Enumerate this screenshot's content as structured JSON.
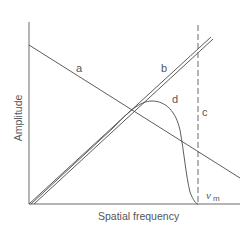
{
  "diagram": {
    "axes": {
      "ylabel": "Amplitude",
      "xlabel": "Spatial frequency"
    },
    "curves": [
      {
        "id": "a",
        "label": "a",
        "description": "straight line decreasing with spatial frequency"
      },
      {
        "id": "b",
        "label": "b",
        "description": "pair of parallel straight lines increasing with spatial frequency"
      },
      {
        "id": "c",
        "label": "c",
        "description": "vertical dashed cutoff line at nu_m"
      },
      {
        "id": "d",
        "label": "d",
        "description": "product curve rising then falling to zero at nu_m"
      }
    ],
    "cutoff": {
      "symbol": "ν",
      "subscript": "m"
    }
  }
}
